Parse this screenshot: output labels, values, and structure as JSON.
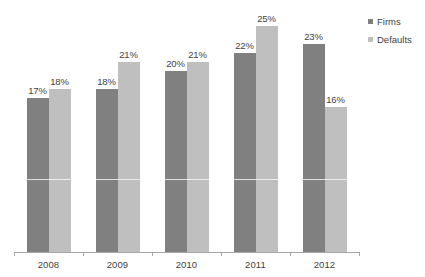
{
  "chart_data": {
    "type": "bar",
    "title": "",
    "subtitle": "",
    "xlabel": "",
    "ylabel": "",
    "categories": [
      "2008",
      "2009",
      "2010",
      "2011",
      "2012"
    ],
    "series": [
      {
        "name": "Firms",
        "color": "#808080",
        "values": [
          17,
          18,
          20,
          22,
          23
        ],
        "labels": [
          "17%",
          "18%",
          "20%",
          "22%",
          "23%"
        ]
      },
      {
        "name": "Defaults",
        "color": "#bfbfbf",
        "values": [
          18,
          21,
          21,
          25,
          16
        ],
        "labels": [
          "18%",
          "21%",
          "21%",
          "25%",
          "16%"
        ]
      }
    ],
    "ylim": [
      0,
      27
    ],
    "grid": false,
    "value_suffix": "%",
    "legend_position": "right-top"
  },
  "legend": {
    "items": [
      {
        "label": "Firms",
        "marker": "square-marker"
      },
      {
        "label": "Defaults",
        "marker": "square-marker"
      }
    ]
  },
  "axis": {
    "categories": [
      "2008",
      "2009",
      "2010",
      "2011",
      "2012"
    ]
  },
  "colors": {
    "firms": "#808080",
    "defaults": "#bfbfbf",
    "axis": "#a6a6a6",
    "text": "#3f3f3f",
    "background": "#ffffff"
  }
}
